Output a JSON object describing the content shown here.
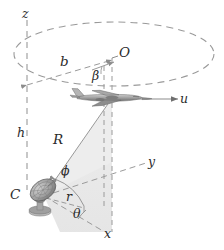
{
  "figure": {
    "background_color": "#ffffff",
    "line_color": "#8c8c8c",
    "label_color": "#2b2b2b",
    "shade_color": "#e8e8e8",
    "aircraft_color": "#9a9a9a",
    "dish_color": "#8f8f8f"
  },
  "labels": {
    "z_axis": "z",
    "y_axis": "y",
    "x_axis": "x",
    "origin_O": "O",
    "radius_b": "b",
    "angle_beta": "β",
    "velocity_u": "u",
    "height_h": "h",
    "range_R": "R",
    "angle_phi": "ϕ",
    "ground_range_r": "r",
    "angle_theta": "θ",
    "station_C": "C"
  },
  "geometry": {
    "circle_path_center": [
      114,
      54
    ],
    "circle_path_rx": 100,
    "circle_path_ry": 32,
    "z_axis_x": 27,
    "z_axis_top_y": 22,
    "z_axis_bottom_y": 190,
    "origin_point": [
      112,
      60
    ],
    "aircraft_point": [
      112,
      99
    ],
    "station_point": [
      44,
      196
    ],
    "y_axis_end": [
      148,
      162
    ],
    "x_axis_end": [
      104,
      232
    ]
  }
}
